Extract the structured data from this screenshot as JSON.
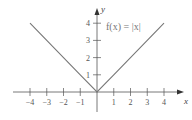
{
  "chart_data": {
    "type": "line",
    "title": "",
    "function_label": "f(x) = |x|",
    "xlabel": "x",
    "ylabel": "y",
    "xlim": [
      -4.5,
      5
    ],
    "ylim": [
      -1,
      5
    ],
    "grid": false,
    "x_ticks": [
      -4,
      -3,
      -2,
      -1,
      1,
      2,
      3,
      4
    ],
    "x_tick_labels": [
      "−4",
      "−3",
      "−2",
      "−1",
      "1",
      "2",
      "3",
      "4"
    ],
    "y_ticks": [
      1,
      2,
      3,
      4
    ],
    "y_tick_labels": [
      "1",
      "2",
      "3",
      "4"
    ],
    "series": [
      {
        "name": "f(x) = |x|",
        "x": [
          -4,
          -3,
          -2,
          -1,
          0,
          1,
          2,
          3,
          4
        ],
        "y": [
          4,
          3,
          2,
          1,
          0,
          1,
          2,
          3,
          4
        ],
        "color": "#777777"
      }
    ]
  }
}
